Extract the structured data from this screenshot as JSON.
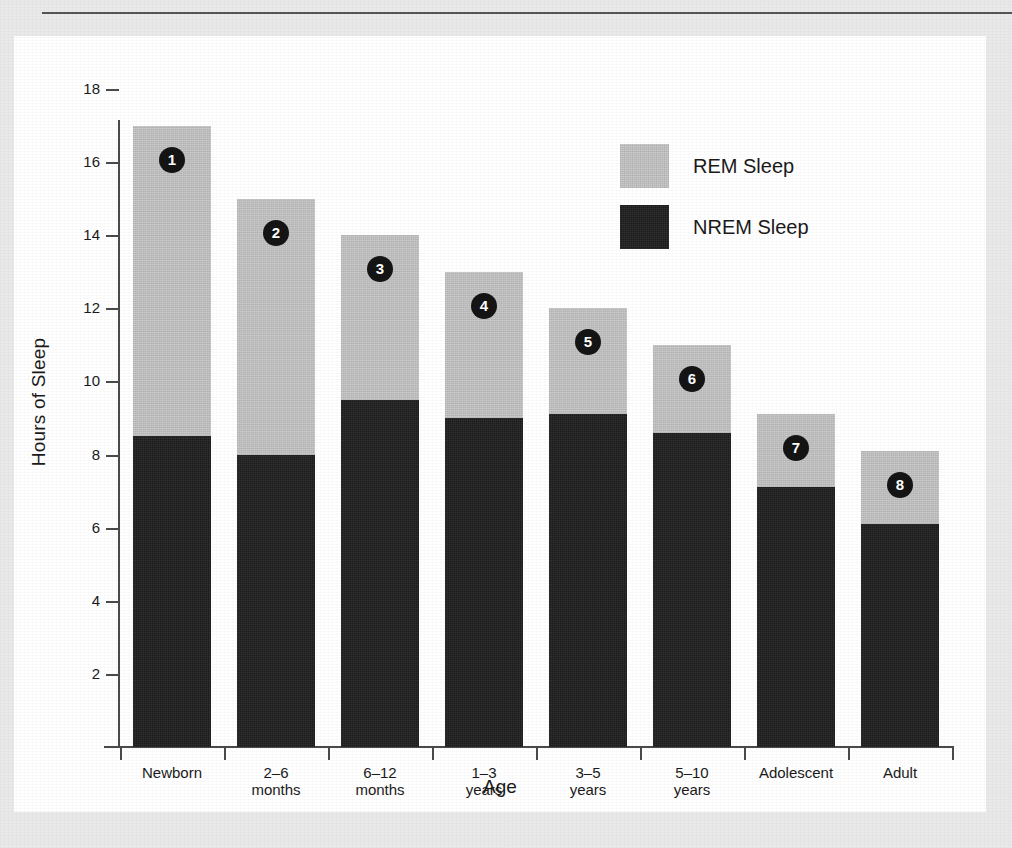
{
  "figure": {
    "y_axis_title": "Hours of Sleep",
    "x_axis_title": "Age"
  },
  "legend": {
    "position": "upper-right",
    "entries": [
      {
        "label": "REM Sleep",
        "color": "#c6c6c6",
        "swatch_name": "legend-swatch-rem"
      },
      {
        "label": "NREM Sleep",
        "color": "#201f1f",
        "swatch_name": "legend-swatch-nrem"
      }
    ]
  },
  "chart_data": {
    "type": "bar",
    "stacked": true,
    "title": "",
    "xlabel": "Age",
    "ylabel": "Hours of Sleep",
    "ylim": [
      0,
      18
    ],
    "yticks": [
      2,
      4,
      6,
      8,
      10,
      12,
      14,
      16,
      18
    ],
    "grid": false,
    "categories": [
      "Newborn",
      "2–6 months",
      "6–12 months",
      "1–3 years",
      "3–5 years",
      "5–10 years",
      "Adolescent",
      "Adult"
    ],
    "category_lines": [
      [
        "Newborn",
        ""
      ],
      [
        "2–6",
        "months"
      ],
      [
        "6–12",
        "months"
      ],
      [
        "1–3",
        "years"
      ],
      [
        "3–5",
        "years"
      ],
      [
        "5–10",
        "years"
      ],
      [
        "Adolescent",
        ""
      ],
      [
        "Adult",
        ""
      ]
    ],
    "series": [
      {
        "name": "NREM Sleep",
        "color": "#201f1f",
        "values": [
          8.5,
          8.0,
          9.5,
          9.0,
          9.1,
          8.6,
          7.1,
          6.1
        ]
      },
      {
        "name": "REM Sleep",
        "color": "#c6c6c6",
        "values": [
          8.5,
          7.0,
          4.5,
          4.0,
          2.9,
          2.4,
          2.0,
          2.0
        ]
      }
    ],
    "totals": [
      17.0,
      15.0,
      14.0,
      13.0,
      12.0,
      11.0,
      9.1,
      8.1
    ],
    "point_badges": [
      "1",
      "2",
      "3",
      "4",
      "5",
      "6",
      "7",
      "8"
    ]
  }
}
